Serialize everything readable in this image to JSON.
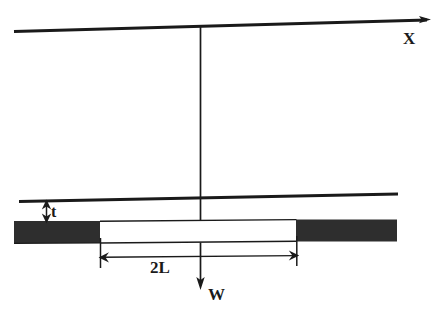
{
  "figure": {
    "kind": "engineering-cross-section-diagram",
    "background_color": "#ffffff",
    "ink_color": "#1a1a1a",
    "fill_color": "#2b2b2b"
  },
  "axes": {
    "horizontal": {
      "name": "x-axis",
      "label": "X",
      "arrow": "right"
    },
    "vertical": {
      "name": "load-line",
      "label": "W",
      "arrow": "down"
    }
  },
  "dimensions": [
    {
      "name": "thickness",
      "label": "t",
      "arrow": "double-vertical"
    },
    {
      "name": "span",
      "label": "2L",
      "arrow": "double-horizontal"
    }
  ],
  "labels": {
    "x": "X",
    "t": "t",
    "span": "2L",
    "w": "W"
  }
}
